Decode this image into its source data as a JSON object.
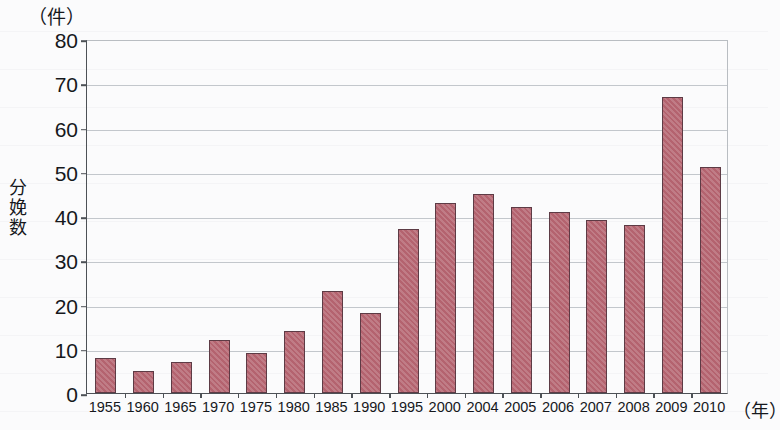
{
  "chart_data": {
    "type": "bar",
    "title": "",
    "subtitle": "",
    "unit_caption": "（件）",
    "ylabel": "分娩数",
    "xlabel": "（年）",
    "categories": [
      "1955",
      "1960",
      "1965",
      "1970",
      "1975",
      "1980",
      "1985",
      "1990",
      "1995",
      "2000",
      "2004",
      "2005",
      "2006",
      "2007",
      "2008",
      "2009",
      "2010"
    ],
    "values": [
      8,
      5,
      7,
      12,
      9,
      14,
      23,
      18,
      37,
      43,
      45,
      42,
      41,
      39,
      38,
      67,
      51
    ],
    "ylim": [
      0,
      80
    ],
    "y_ticks": [
      0,
      10,
      20,
      30,
      40,
      50,
      60,
      70,
      80
    ],
    "y_tick_labels": [
      "0",
      "10",
      "20",
      "30",
      "40",
      "50",
      "60",
      "70",
      "80"
    ],
    "grid": true,
    "legend": "none",
    "series": [
      {
        "name": "分娩数",
        "values": [
          8,
          5,
          7,
          12,
          9,
          14,
          23,
          18,
          37,
          43,
          45,
          42,
          41,
          39,
          38,
          67,
          51
        ]
      }
    ],
    "colors": {
      "bar_fill": "#b4636f",
      "bar_border": "#5d3b45",
      "gridline": "#c3c7cc",
      "axis": "#4d5156",
      "text": "#16181c",
      "background": "#fbfbfc"
    }
  }
}
